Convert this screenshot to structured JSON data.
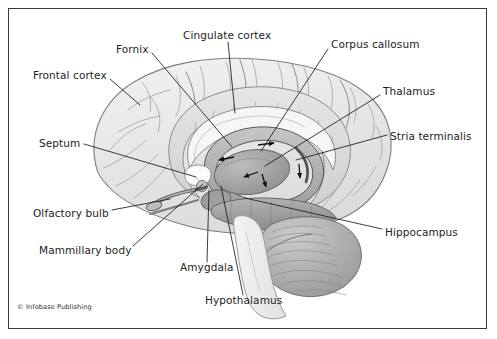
{
  "figure": {
    "credit": "© Infobase Publishing",
    "border_color": "#3a3a3a",
    "background": "#ffffff",
    "text_color": "#1d1d1d",
    "leader_color": "#1a1a1a"
  },
  "labels": [
    {
      "id": "frontal-cortex",
      "text": "Frontal cortex",
      "x": 33,
      "y": 76,
      "anchor": "start"
    },
    {
      "id": "fornix",
      "text": "Fornix",
      "x": 116,
      "y": 50,
      "anchor": "start"
    },
    {
      "id": "cingulate-cortex",
      "text": "Cingulate cortex",
      "x": 183,
      "y": 36,
      "anchor": "start"
    },
    {
      "id": "corpus-callosum",
      "text": "Corpus callosum",
      "x": 331,
      "y": 45,
      "anchor": "start"
    },
    {
      "id": "thalamus",
      "text": "Thalamus",
      "x": 383,
      "y": 92,
      "anchor": "start"
    },
    {
      "id": "stria-terminalis",
      "text": "Stria terminalis",
      "x": 390,
      "y": 137,
      "anchor": "start"
    },
    {
      "id": "septum",
      "text": "Septum",
      "x": 39,
      "y": 144,
      "anchor": "start"
    },
    {
      "id": "olfactory-bulb",
      "text": "Olfactory bulb",
      "x": 33,
      "y": 214,
      "anchor": "start"
    },
    {
      "id": "mammillary-body",
      "text": "Mammillary body",
      "x": 39,
      "y": 251,
      "anchor": "start"
    },
    {
      "id": "amygdala",
      "text": "Amygdala",
      "x": 180,
      "y": 268,
      "anchor": "start"
    },
    {
      "id": "hypothalamus",
      "text": "Hypothalamus",
      "x": 205,
      "y": 301,
      "anchor": "start"
    },
    {
      "id": "hippocampus",
      "text": "Hippocampus",
      "x": 385,
      "y": 233,
      "anchor": "start"
    }
  ],
  "leader_lines": [
    {
      "id": "leader-frontal-cortex",
      "points": "110,79 140,105"
    },
    {
      "id": "leader-fornix",
      "points": "152,53 232,147"
    },
    {
      "id": "leader-cingulate-cortex",
      "points": "228,42 235,113"
    },
    {
      "id": "leader-corpus-callosum",
      "points": "328,49 261,151"
    },
    {
      "id": "leader-thalamus",
      "points": "380,95 265,166"
    },
    {
      "id": "leader-stria-terminalis",
      "points": "387,135 296,160"
    },
    {
      "id": "leader-septum",
      "points": "84,144 196,177"
    },
    {
      "id": "leader-olfactory-bulb",
      "points": "112,210 170,199"
    },
    {
      "id": "leader-mammillary-body",
      "points": "133,246 203,184"
    },
    {
      "id": "leader-amygdala",
      "points": "207,262 209,190"
    },
    {
      "id": "leader-hypothalamus",
      "points": "243,295 221,186"
    },
    {
      "id": "leader-hippocampus",
      "points": "382,229 245,198"
    }
  ],
  "structures": {
    "cerebrum": {
      "name": "cerebral cortex",
      "fill": "#e9e9e9",
      "stroke": "#8e8e8e"
    },
    "cingulate": {
      "name": "cingulate gyrus",
      "fill": "#dcdcdc",
      "stroke": "#8a8a8a"
    },
    "corpus_callosum": {
      "name": "corpus callosum",
      "fill": "#f4f4f4",
      "stroke": "#8a8a8a"
    },
    "fornix_ring": {
      "name": "fornix",
      "fill": "#b4b4b4",
      "stroke": "#5c5c5c"
    },
    "thalamus": {
      "name": "thalamus",
      "fill": "#a8a8a8",
      "stroke": "#6a6a6a"
    },
    "hippocampus": {
      "name": "hippocampus",
      "fill": "#a0a0a0",
      "stroke": "#6a6a6a"
    },
    "amygdala": {
      "name": "amygdala",
      "fill": "#9a9a9a",
      "stroke": "#666666"
    },
    "cerebellum": {
      "name": "cerebellum",
      "fill": "#b0b0b0",
      "stroke": "#6e6e6e"
    },
    "brainstem": {
      "name": "brainstem",
      "fill": "#ededed",
      "stroke": "#9a9a9a"
    },
    "olfactory_tract": {
      "name": "olfactory tract",
      "fill": "#b8b8b8",
      "stroke": "#5e5e5e"
    }
  },
  "flow_arrows": [
    {
      "id": "arrow-cingulum-top",
      "x": 268,
      "y": 146,
      "rotate": -18
    },
    {
      "id": "arrow-fornix-anterior",
      "x": 224,
      "y": 155,
      "rotate": 196
    },
    {
      "id": "arrow-fornix-inferior",
      "x": 265,
      "y": 180,
      "rotate": 105
    },
    {
      "id": "arrow-stria-lateral",
      "x": 299,
      "y": 172,
      "rotate": 95
    },
    {
      "id": "arrow-hippo-return",
      "x": 250,
      "y": 174,
      "rotate": 165
    }
  ]
}
